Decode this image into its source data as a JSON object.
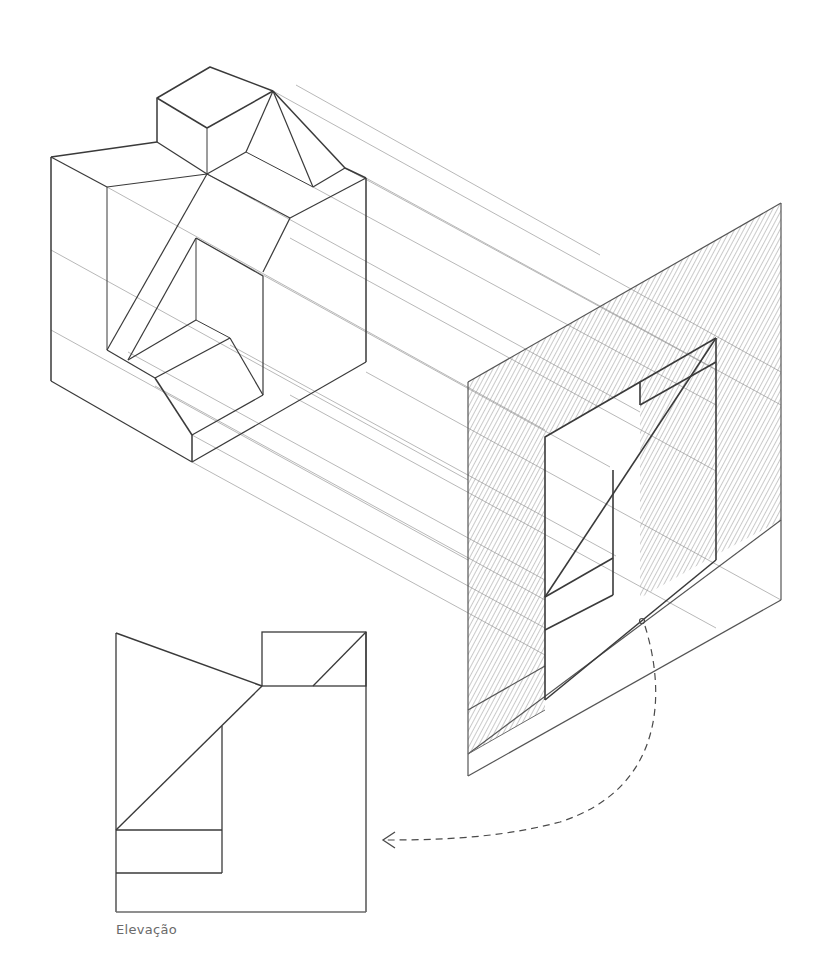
{
  "colors": {
    "background": "#ffffff",
    "line_strong": "#3a3a3a",
    "line_medium": "#555555",
    "line_faint": "#9a9a9a",
    "hatch": "#8a8a8a",
    "label": "#6a6a6a"
  },
  "labels": {
    "elevation": "Elevação"
  },
  "components": [
    {
      "name": "isometric-block",
      "description": "Freehand isometric sketch of a stepped solid with a sloped notch"
    },
    {
      "name": "projection-plane",
      "description": "Vertical projection plane with diagonally hatched section silhouette"
    },
    {
      "name": "projection-lines",
      "description": "Faint parallel projector lines from block to plane"
    },
    {
      "name": "rotation-arrow",
      "description": "Dashed curved arrow indicating rotation of the plane into the elevation view"
    },
    {
      "name": "elevation-view",
      "description": "Orthographic elevation drawing resulting from the projection"
    }
  ]
}
